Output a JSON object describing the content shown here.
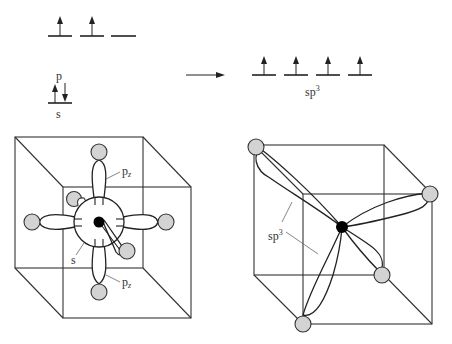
{
  "energy_diagram": {
    "ground_state": {
      "p_label": "p",
      "s_label": "s",
      "p_orbitals": [
        {
          "electron": "up"
        },
        {
          "electron": "up"
        },
        {
          "electron": "none"
        }
      ],
      "s_orbital": {
        "electrons": [
          "up",
          "down"
        ]
      }
    },
    "arrow": "right-arrow",
    "hybrid_state": {
      "label": "sp",
      "label_sup": "3",
      "orbitals": [
        {
          "electron": "up"
        },
        {
          "electron": "up"
        },
        {
          "electron": "up"
        },
        {
          "electron": "up"
        }
      ]
    }
  },
  "left_cube": {
    "labels": {
      "pz_top": "p",
      "pz_top_sub": "z",
      "pz_bottom": "p",
      "pz_bottom_sub": "z",
      "s": "s"
    }
  },
  "right_cube": {
    "labels": {
      "sp3": "sp",
      "sp3_sup": "3"
    }
  },
  "colors": {
    "line": "#222222",
    "sphere_fill": "#d3d3d3",
    "nucleus": "#000000",
    "leader": "#666666"
  }
}
